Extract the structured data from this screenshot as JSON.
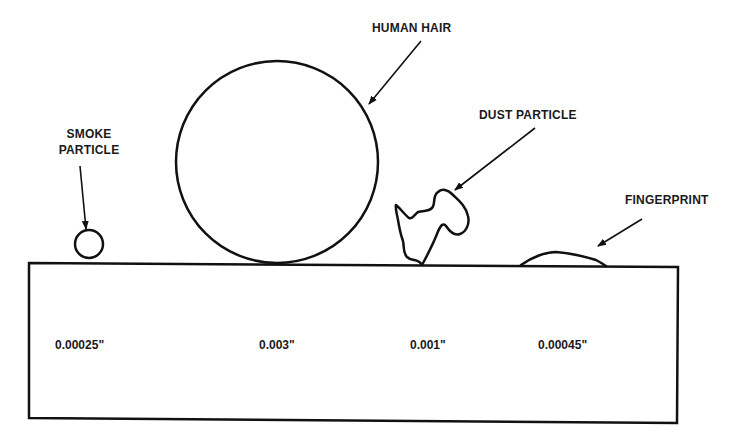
{
  "diagram": {
    "colors": {
      "stroke": "#111111",
      "background": "#ffffff",
      "text": "#1a1a1a"
    },
    "labels": {
      "smoke_line1": "SMOKE",
      "smoke_line2": "PARTICLE",
      "hair": "HUMAN HAIR",
      "dust": "DUST PARTICLE",
      "fingerprint": "FINGERPRINT"
    },
    "sizes": {
      "smoke": "0.00025\"",
      "hair": "0.003\"",
      "dust": "0.001\"",
      "fingerprint": "0.00045\""
    },
    "contaminants": [
      {
        "name": "Smoke particle",
        "size": "0.00025\"",
        "shape": "small circle"
      },
      {
        "name": "Human hair",
        "size": "0.003\"",
        "shape": "large circle"
      },
      {
        "name": "Dust particle",
        "size": "0.001\"",
        "shape": "irregular blob"
      },
      {
        "name": "Fingerprint",
        "size": "0.00045\"",
        "shape": "low mound"
      }
    ]
  }
}
